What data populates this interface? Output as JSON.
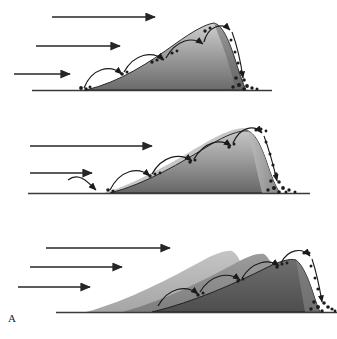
{
  "figure": {
    "label": "A",
    "width": 337,
    "height": 339
  },
  "colors": {
    "background": "#ffffff",
    "ink": "#1a1a1a",
    "ground_line": "#3a3a3a",
    "arrow": "#2b2b2b",
    "grain": "#1c1c1c",
    "dune_crest": "#c9c9c9",
    "dune_base": "#6f6f6f",
    "dune_outline": "#171717",
    "slipface_light": "#b4b4b4",
    "ghost_t1": "#b9b9b9",
    "ghost_t2": "#8e8e8e",
    "ghost_t3": "#5f5f5f"
  },
  "panels": [
    {
      "name": "panel-initial-dune",
      "index": 1,
      "stage_label": "",
      "wind_arrows": [
        {
          "name": "wind-arrow-upper",
          "length_label": "long"
        },
        {
          "name": "wind-arrow-middle",
          "length_label": "medium"
        },
        {
          "name": "wind-arrow-lower",
          "length_label": "short"
        }
      ],
      "saltation_hops": 5,
      "grain_clusters": 6,
      "dune_count": 1
    },
    {
      "name": "panel-migrating-dune",
      "index": 2,
      "stage_label": "",
      "wind_arrows": [
        {
          "name": "wind-arrow-upper",
          "length_label": "long"
        },
        {
          "name": "wind-arrow-middle",
          "length_label": "medium"
        }
      ],
      "saltation_hops": 5,
      "grain_clusters": 7,
      "dune_count": 2
    },
    {
      "name": "panel-successive-dunes",
      "index": 3,
      "stage_label": "",
      "wind_arrows": [
        {
          "name": "wind-arrow-upper",
          "length_label": "long"
        },
        {
          "name": "wind-arrow-middle",
          "length_label": "medium"
        },
        {
          "name": "wind-arrow-lower",
          "length_label": "short"
        }
      ],
      "saltation_hops": 5,
      "grain_clusters": 5,
      "dune_count": 3
    }
  ]
}
